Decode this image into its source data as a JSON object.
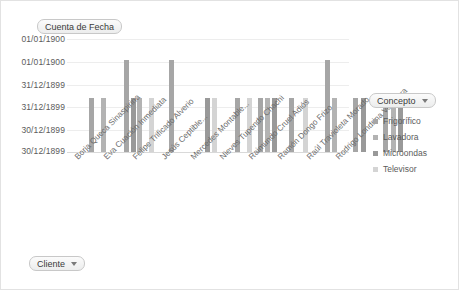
{
  "window": {
    "title": "Gráfico dinámico"
  },
  "fields": {
    "value_field": {
      "label": "Cuenta de Fecha",
      "caret": "chevron-down-icon"
    },
    "row_field": {
      "label": "Cliente",
      "caret": "chevron-down-icon"
    },
    "series_field": {
      "label": "Concepto",
      "caret": "chevron-down-icon"
    }
  },
  "legend": {
    "title": "Concepto",
    "items": [
      {
        "label": "Frigorífico",
        "color": "#a6a6a6"
      },
      {
        "label": "Lavadora",
        "color": "#b3b3b3"
      },
      {
        "label": "Microondas",
        "color": "#999999"
      },
      {
        "label": "Televisor",
        "color": "#d4d4d4"
      }
    ]
  },
  "chart_data": {
    "type": "bar",
    "title": "Cuenta de Fecha",
    "xlabel": "Cliente",
    "ylabel": "Cuenta de Fecha",
    "grid": true,
    "legend_position": "right",
    "ytick_labels": [
      "01/01/1900",
      "01/01/1900",
      "31/12/1899",
      "31/12/1899",
      "30/12/1899",
      "30/12/1899"
    ],
    "ylim": [
      0,
      3
    ],
    "categories": [
      "Borja Queca Sinaspirina",
      "Eva Cuación Inmediata",
      "Felipe Trificado Alverio",
      "Jesús Ceptible...",
      "Mercedes Montable...",
      "Nieves Tupendo Chachi",
      "Raimundo Cruel Adiós",
      "Ramón Dongo Frizo",
      "Raúl Travioleta Morado",
      "Rodrigo Londrina Voladora"
    ],
    "series": [
      {
        "name": "Frigorífico",
        "color": "#a6a6a6",
        "values": [
          1,
          0,
          2,
          0,
          1,
          1,
          1,
          2,
          1,
          1
        ]
      },
      {
        "name": "Lavadora",
        "color": "#b3b3b3",
        "values": [
          0,
          1,
          1,
          1,
          1,
          1,
          0,
          1,
          1,
          1
        ]
      },
      {
        "name": "Microondas",
        "color": "#999999",
        "values": [
          0,
          0,
          1,
          0,
          0,
          1,
          1,
          1,
          1,
          1
        ]
      },
      {
        "name": "Televisor",
        "color": "#d4d4d4",
        "values": [
          0,
          0,
          0,
          1,
          1,
          0,
          1,
          0,
          0,
          0
        ]
      }
    ],
    "bars": [
      {
        "x": 22,
        "h": 47,
        "color": "#a6a6a6"
      },
      {
        "x": 34,
        "h": 47,
        "color": "#b3b3b3"
      },
      {
        "x": 57,
        "h": 80,
        "color": "#a6a6a6"
      },
      {
        "x": 64,
        "h": 47,
        "color": "#999999"
      },
      {
        "x": 70,
        "h": 47,
        "color": "#b3b3b3"
      },
      {
        "x": 82,
        "h": 47,
        "color": "#d4d4d4"
      },
      {
        "x": 102,
        "h": 80,
        "color": "#a6a6a6"
      },
      {
        "x": 138,
        "h": 47,
        "color": "#999999"
      },
      {
        "x": 145,
        "h": 47,
        "color": "#d4d4d4"
      },
      {
        "x": 168,
        "h": 47,
        "color": "#a6a6a6"
      },
      {
        "x": 180,
        "h": 47,
        "color": "#d4d4d4"
      },
      {
        "x": 191,
        "h": 47,
        "color": "#a6a6a6"
      },
      {
        "x": 198,
        "h": 47,
        "color": "#b3b3b3"
      },
      {
        "x": 205,
        "h": 47,
        "color": "#999999"
      },
      {
        "x": 222,
        "h": 47,
        "color": "#a6a6a6"
      },
      {
        "x": 236,
        "h": 47,
        "color": "#d4d4d4"
      },
      {
        "x": 258,
        "h": 80,
        "color": "#a6a6a6"
      },
      {
        "x": 265,
        "h": 47,
        "color": "#b3b3b3"
      },
      {
        "x": 286,
        "h": 47,
        "color": "#a6a6a6"
      },
      {
        "x": 294,
        "h": 47,
        "color": "#999999"
      },
      {
        "x": 316,
        "h": 47,
        "color": "#a6a6a6"
      },
      {
        "x": 324,
        "h": 47,
        "color": "#b3b3b3"
      },
      {
        "x": 331,
        "h": 47,
        "color": "#999999"
      }
    ]
  }
}
